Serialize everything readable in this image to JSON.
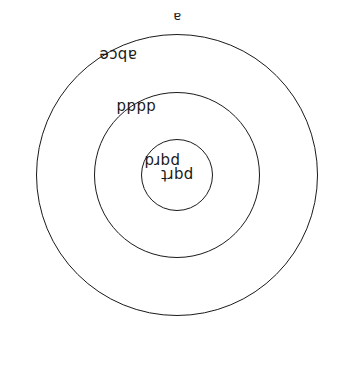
{
  "diagram": {
    "type": "nested-circles",
    "orientation": "rotated-180",
    "outer_label": "a",
    "regions": [
      {
        "id": "ring-outer",
        "label": "abce"
      },
      {
        "id": "ring-second",
        "label": "dddd"
      },
      {
        "id": "ring-third",
        "label": "pqrd"
      },
      {
        "id": "core",
        "label": "pqrt"
      }
    ],
    "circles": [
      {
        "id": "circle-outer",
        "diameter": 282
      },
      {
        "id": "circle-middle",
        "diameter": 166
      },
      {
        "id": "circle-inner",
        "diameter": 72
      }
    ],
    "stroke_color": "#1a1a1a",
    "fill_color": "#ffffff"
  }
}
